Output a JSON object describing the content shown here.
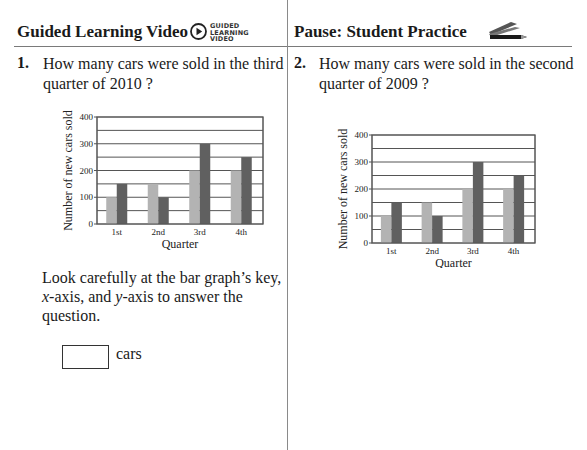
{
  "header": {
    "left_title": "Guided Learning Video",
    "left_badge_lines": [
      "GUIDED",
      "LEARNING",
      "VIDEO"
    ],
    "left_icon": "play-circle-icon",
    "right_title": "Pause: Student Practice",
    "right_icon": "pencils-icon"
  },
  "question1": {
    "number": "1.",
    "line1": "How many cars were sold in the third",
    "line2": "quarter of 2010 ?",
    "instructions": {
      "part1": "Look carefully at the bar graph’s key,",
      "x_italic": "x",
      "part2": "-axis, and ",
      "y_italic": "y",
      "part3": "-axis to answer the",
      "part4": "question."
    },
    "answer_value": "",
    "answer_unit": "cars"
  },
  "question2": {
    "number": "2.",
    "line1": "How many cars were sold in the second",
    "line2": "quarter of 2009 ?"
  },
  "colors": {
    "series_light": "#b3b3b3",
    "series_dark": "#606060",
    "grid": "#555555"
  },
  "chart_data": [
    {
      "type": "bar",
      "title": "",
      "xlabel": "Quarter",
      "ylabel": "Number of new cars sold",
      "categories": [
        "1st",
        "2nd",
        "3rd",
        "4th"
      ],
      "series": [
        {
          "name": "light",
          "values": [
            100,
            150,
            200,
            200
          ]
        },
        {
          "name": "dark",
          "values": [
            150,
            100,
            300,
            250
          ]
        }
      ],
      "yticks": [
        "0",
        "100",
        "200",
        "300",
        "400"
      ],
      "ylim": [
        0,
        400
      ],
      "grid": true,
      "legend": "none visible"
    },
    {
      "type": "bar",
      "title": "",
      "xlabel": "Quarter",
      "ylabel": "Number of new cars sold",
      "categories": [
        "1st",
        "2nd",
        "3rd",
        "4th"
      ],
      "series": [
        {
          "name": "light",
          "values": [
            100,
            150,
            200,
            200
          ]
        },
        {
          "name": "dark",
          "values": [
            150,
            100,
            300,
            250
          ]
        }
      ],
      "yticks": [
        "0",
        "100",
        "200",
        "300",
        "400"
      ],
      "ylim": [
        0,
        400
      ],
      "grid": true,
      "legend": "none visible"
    }
  ]
}
